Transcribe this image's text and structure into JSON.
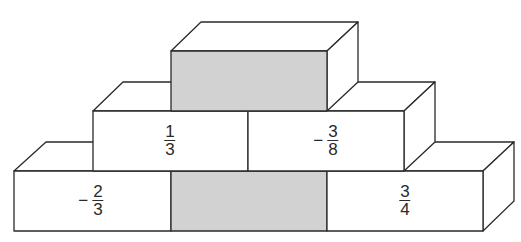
{
  "diagram": {
    "colors": {
      "line": "#2a2a2a",
      "face": "#ffffff",
      "shaded": "#d2d2d2"
    },
    "bricks": [
      {
        "id": "top",
        "row": 1,
        "position": "center",
        "shaded": true,
        "value": null
      },
      {
        "id": "middle-left",
        "row": 2,
        "position": "left",
        "shaded": false,
        "value": {
          "sign": "",
          "numerator": "1",
          "denominator": "3"
        }
      },
      {
        "id": "middle-right",
        "row": 2,
        "position": "right",
        "shaded": false,
        "value": {
          "sign": "−",
          "numerator": "3",
          "denominator": "8"
        }
      },
      {
        "id": "bottom-left",
        "row": 3,
        "position": "left",
        "shaded": false,
        "value": {
          "sign": "−",
          "numerator": "2",
          "denominator": "3"
        }
      },
      {
        "id": "bottom-center",
        "row": 3,
        "position": "center",
        "shaded": true,
        "value": null
      },
      {
        "id": "bottom-right",
        "row": 3,
        "position": "right",
        "shaded": false,
        "value": {
          "sign": "",
          "numerator": "3",
          "denominator": "4"
        }
      }
    ]
  }
}
